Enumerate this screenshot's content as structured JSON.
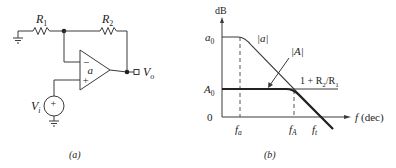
{
  "figure_a": {
    "caption": "(a)",
    "labels": {
      "R1": "R",
      "R1_sub": "1",
      "R2": "R",
      "R2_sub": "2",
      "opamp_gain": "a",
      "minus": "−",
      "plus": "+",
      "source_sign": "+",
      "Vi": "V",
      "Vi_sub": "i",
      "Vo": "V",
      "Vo_sub": "o"
    }
  },
  "figure_b": {
    "caption": "(b)",
    "y_axis_label": "dB",
    "x_axis_label": "f (dec)",
    "x_axis_f": "f",
    "x_axis_unit": "(dec)",
    "levels": {
      "a0": "a",
      "a0_sub": "0",
      "A0": "A",
      "A0_sub": "0",
      "zero": "0"
    },
    "x_ticks": {
      "fa": "f",
      "fa_sub": "a",
      "fA": "f",
      "fA_sub": "A",
      "ft": "f",
      "ft_sub": "t"
    },
    "curve_labels": {
      "open_loop": "|a|",
      "closed_loop": "|A|",
      "ideal_gain_pre": "1 + R",
      "ideal_gain_sub1": "2",
      "ideal_gain_mid": "/R",
      "ideal_gain_sub2": "1"
    }
  },
  "colors": {
    "line": "#3a3a3a",
    "thick": "#2a2a2a",
    "text": "#222222"
  }
}
